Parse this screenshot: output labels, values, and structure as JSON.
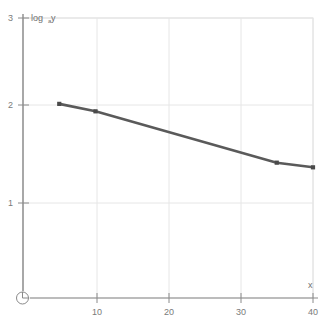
{
  "chart_data": {
    "type": "line",
    "title": "",
    "subtitle": "",
    "xlabel": "x",
    "ylabel": "log",
    "ylabel_sub": "a",
    "ylabel_tail": "y",
    "xlim": [
      0,
      40
    ],
    "ylim": [
      0,
      3
    ],
    "grid": true,
    "legend": null,
    "xticks": [
      10,
      20,
      30,
      40
    ],
    "xtick_labels": [
      "10",
      "20",
      "30",
      "40"
    ],
    "yticks": [
      1,
      2,
      3
    ],
    "ytick_labels": [
      "1",
      "2",
      "3"
    ],
    "axis_break_symbol": "origin-break-circle",
    "series": [
      {
        "name": "log_a y vs x",
        "color": "#5a5a5a",
        "marker": "square",
        "x": [
          5,
          10,
          35,
          40
        ],
        "y": [
          2.08,
          2.0,
          1.45,
          1.4
        ]
      }
    ],
    "annotations": []
  },
  "colors": {
    "line": "#5a5a5a",
    "marker": "#4a4a4a",
    "grid": "#e3e3e3",
    "frame": "#d8d8d8",
    "axis": "#8a8a8a",
    "text": "#7a7a7a",
    "background": "#ffffff"
  }
}
